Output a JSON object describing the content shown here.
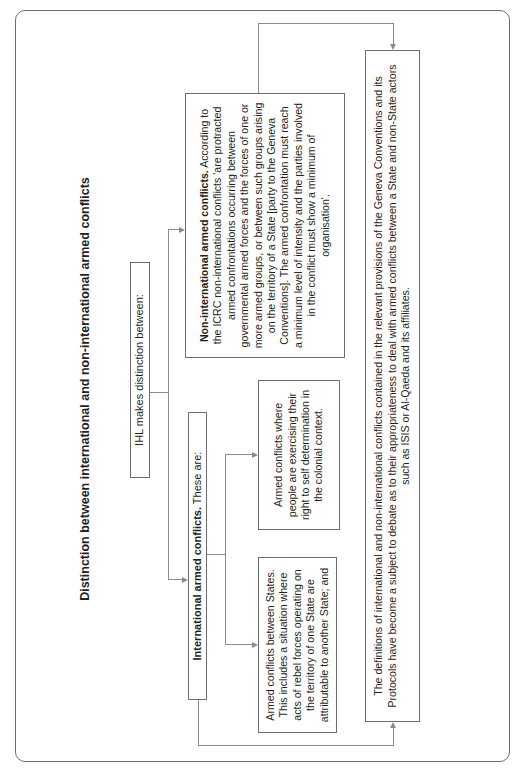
{
  "title": "Distinction between international and non-international armed conflicts",
  "root": {
    "label": "IHL makes distinction between:"
  },
  "international": {
    "heading_bold": "International armed conflicts.",
    "heading_rest": " These are:",
    "children": [
      {
        "text": "Armed conflicts between States. This includes a situation where acts of rebel forces operating on the territory of one State are attributable to another State; and"
      },
      {
        "text": "Armed conflicts where people are exercising their right to self determination in the colonial context."
      }
    ]
  },
  "non_international": {
    "heading_bold": "Non-international armed conflicts.",
    "heading_rest": " According to the ICRC non-international conflicts 'are protracted armed confrontations occurring between governmental armed forces and the forces of one or more armed groups, or between such groups arising on the territory of a State [party to the Geneva Conventions]. The armed confrontation must reach a minimum level of intensity and the parties involved in the conflict must show a minimum of organisation'."
  },
  "conclusion": {
    "text": "The definitions of international and non-international conflicts contained in the relevant provisions of the Geneva Conventions and its Protocols have become a subject to debate as to their appropriateness to deal with armed conflicts between a State and non-State actors such as ISIS or Al-Qaeda and its affiliates."
  },
  "colors": {
    "text": "#231f20",
    "border": "#6d6e70",
    "connector": "#8a8b8d",
    "background": "#ffffff"
  }
}
